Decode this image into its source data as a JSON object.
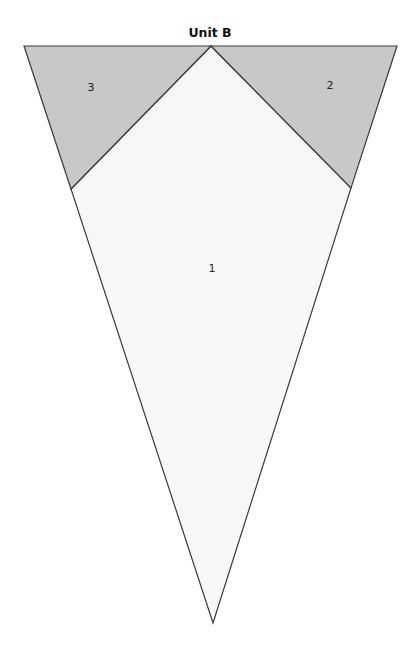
{
  "title": "Unit B",
  "colors": {
    "shaded": "#c8c8c8",
    "light": "#f7f7f7",
    "stroke": "#3a3a3a"
  },
  "pieces": [
    {
      "id": "1",
      "label": "1",
      "points": "71,189 211,46 351,188 213,623",
      "fill": "#f7f7f7",
      "label_x": 212,
      "label_y": 272
    },
    {
      "id": "2",
      "label": "2",
      "points": "211,46 397,46 351,188",
      "fill": "#c8c8c8",
      "label_x": 330,
      "label_y": 89
    },
    {
      "id": "3",
      "label": "3",
      "points": "24,46 211,46 71,189",
      "fill": "#c8c8c8",
      "label_x": 91,
      "label_y": 91
    }
  ]
}
